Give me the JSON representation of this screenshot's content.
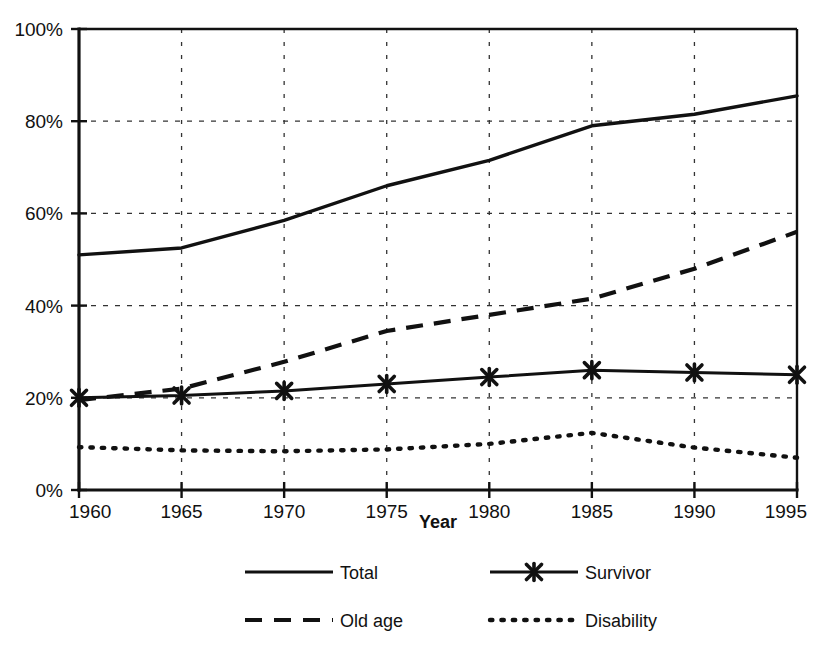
{
  "chart_data": {
    "type": "line",
    "title": "",
    "xlabel": "Year",
    "ylabel": "",
    "x": [
      1960,
      1965,
      1970,
      1975,
      1980,
      1985,
      1990,
      1995
    ],
    "categories": [
      "1960",
      "1965",
      "1970",
      "1975",
      "1980",
      "1985",
      "1990",
      "1995"
    ],
    "series": [
      {
        "name": "Total",
        "style": "solid",
        "marker": "none",
        "values": [
          51,
          52.5,
          58.5,
          66,
          71.5,
          79,
          81.5,
          85.5
        ]
      },
      {
        "name": "Survivor",
        "style": "solid",
        "marker": "x",
        "values": [
          20,
          20.5,
          21.5,
          23,
          24.5,
          26,
          25.5,
          25
        ]
      },
      {
        "name": "Old age",
        "style": "dashed",
        "marker": "none",
        "values": [
          19.5,
          22,
          27.8,
          34.5,
          38,
          41.5,
          48,
          56
        ]
      },
      {
        "name": "Disability",
        "style": "dotted",
        "marker": "none",
        "values": [
          9.3,
          8.6,
          8.4,
          8.8,
          10,
          12.4,
          9.2,
          7
        ]
      }
    ],
    "ylim": [
      0,
      100
    ],
    "ytick_values": [
      0,
      20,
      40,
      60,
      80,
      100
    ],
    "ytick_labels": [
      "0%",
      "20%",
      "40%",
      "60%",
      "80%",
      "100%"
    ],
    "xlim": [
      1960,
      1995
    ],
    "grid": true,
    "grid_style": "dotted",
    "legend_position": "bottom",
    "legend_entries": [
      {
        "label": "Total",
        "style": "solid",
        "marker": "none"
      },
      {
        "label": "Survivor",
        "style": "solid",
        "marker": "x"
      },
      {
        "label": "Old age",
        "style": "dashed",
        "marker": "none"
      },
      {
        "label": "Disability",
        "style": "dotted",
        "marker": "none"
      }
    ],
    "colors": {
      "line": "#111111",
      "grid": "#333333",
      "background": "#ffffff"
    }
  }
}
